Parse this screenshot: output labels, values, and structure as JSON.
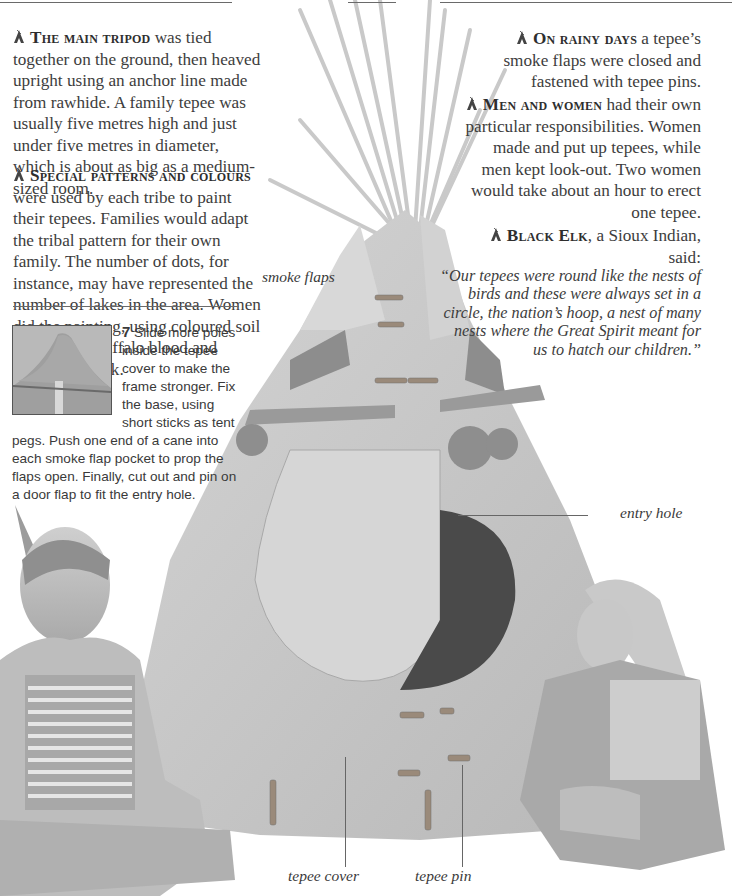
{
  "page": {
    "background": "#ffffff",
    "text_color": "#3d3d3d",
    "bullet_icon": "tepee-icon"
  },
  "left_column": {
    "paragraphs": [
      {
        "lead": "The main tripod",
        "body": " was tied together on the ground, then heaved upright using an anchor line made from rawhide. A family tepee was usually five metres high and just under five metres in diameter, which is about as big as a medium-sized room."
      },
      {
        "lead": "Special patterns and colours",
        "body": " were used by each tribe to paint their tepees. Families would adapt the tribal pattern for their own family. The number of dots, for instance, may have represented the number of lakes in the area. Women did the painting, using coloured soil mixed with buffalo blood and ground-up rock."
      }
    ]
  },
  "right_column": {
    "paragraphs": [
      {
        "lead": "On rainy days",
        "body": " a tepee’s smoke flaps were closed and fastened with tepee pins."
      },
      {
        "lead": "Men and women",
        "body": " had their own particular responsibilities. Women made and put up tepees, while men kept look-out. Two women would take about an hour to erect one tepee."
      },
      {
        "lead": "Black Elk",
        "body": ", a Sioux Indian, said:",
        "quote": "“Our tepees were round like the nests of birds and these were always set in a circle, the nation’s hoop, a nest of many nests where the Great Spirit meant for us to hatch our children.”"
      }
    ]
  },
  "step": {
    "number": "7",
    "text": " Slide more poles inside the tepee cover to make the frame stronger. Fix the base, using short sticks as tent pegs. Push one end of a cane into each smoke flap pocket to prop the flaps open. Finally, cut out and pin on a door flap to fit the entry hole."
  },
  "captions": {
    "smoke_flaps": "smoke flaps",
    "entry_hole": "entry hole",
    "tepee_cover": "tepee cover",
    "tepee_pin": "tepee pin"
  }
}
